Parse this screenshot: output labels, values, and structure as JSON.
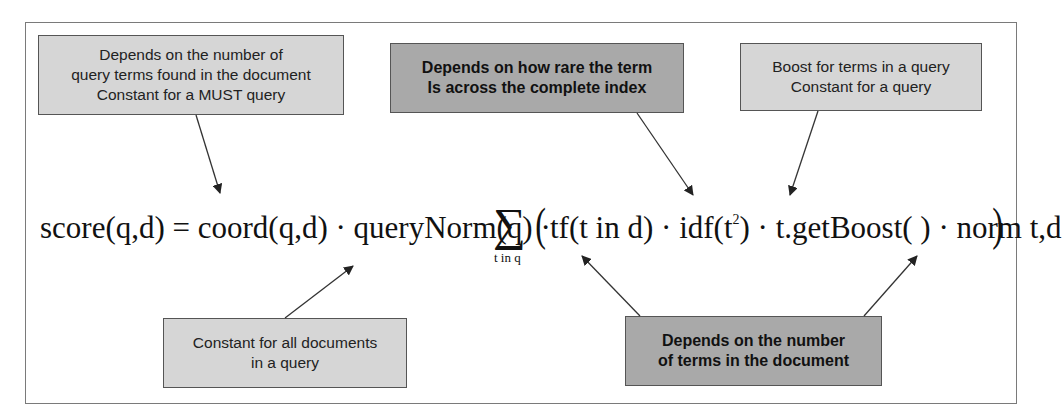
{
  "diagram": {
    "formula": {
      "lhs": "score(q,d) = coord(q,d) · queryNorm(q) ·",
      "sum_symbol": "∑",
      "sum_subscript": "t in q",
      "open_paren": "(",
      "body_before_sup": "tf(t in d) · idf(t",
      "sup": "2",
      "body_after_sup": ") · t.getBoost( ) · norm t,d",
      "close_paren": ")"
    },
    "annotations": [
      {
        "id": "coord",
        "style": "light",
        "lines": [
          "Depends on the number of",
          "query terms found in the document",
          "Constant for a MUST query"
        ],
        "points_to": "coord(q,d)"
      },
      {
        "id": "idf",
        "style": "dark",
        "lines": [
          "Depends on how rare the term",
          "Is across the complete index"
        ],
        "points_to": "idf(t2)"
      },
      {
        "id": "boost",
        "style": "light",
        "lines": [
          "Boost for terms in a query",
          "Constant for a query"
        ],
        "points_to": "t.getBoost()"
      },
      {
        "id": "querynorm",
        "style": "light",
        "lines": [
          "Constant for all documents",
          "in a query"
        ],
        "points_to": "queryNorm(q)"
      },
      {
        "id": "tf-norm",
        "style": "dark",
        "lines": [
          "Depends on the number",
          "of terms in the document"
        ],
        "points_to": [
          "tf(t in d)",
          "norm t,d"
        ]
      }
    ],
    "colors": {
      "light_box": "#d6d6d6",
      "dark_box": "#a9a9a9",
      "border": "#555555",
      "frame": "#7a7a7a",
      "arrow": "#333333"
    }
  }
}
